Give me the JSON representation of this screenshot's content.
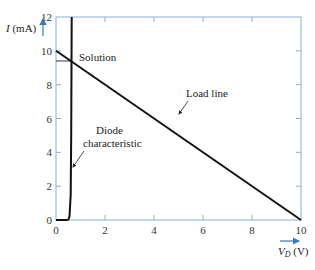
{
  "chart_data": {
    "type": "line",
    "title": "",
    "xlabel": "V_D (V)",
    "xlabel_main": "V",
    "xlabel_sub": "D",
    "xlabel_unit": " (V)",
    "ylabel": "I (mA)",
    "ylabel_main": "I",
    "ylabel_unit": " (mA)",
    "xlim": [
      0,
      10
    ],
    "ylim": [
      0,
      12
    ],
    "xticks": [
      0,
      2,
      4,
      6,
      8,
      10
    ],
    "yticks": [
      0,
      2,
      4,
      6,
      8,
      10,
      12
    ],
    "grid": false,
    "series": [
      {
        "name": "Load line",
        "x": [
          0,
          10
        ],
        "y": [
          10,
          0
        ]
      },
      {
        "name": "Diode characteristic",
        "x": [
          0,
          0.4,
          0.5,
          0.55,
          0.6,
          0.62,
          0.64
        ],
        "y": [
          0,
          0,
          0.02,
          0.2,
          1.5,
          5,
          12
        ]
      }
    ],
    "annotations": [
      {
        "text": "Solution",
        "x": 0.62,
        "y": 9.4
      },
      {
        "text": "Load line",
        "x": 4.8,
        "y": 5.3
      },
      {
        "text": "Diode",
        "x": 0.64,
        "y": 3.2
      },
      {
        "text": "characteristic",
        "x": 0.64,
        "y": 3.2
      }
    ],
    "solution_point": {
      "x": 0.62,
      "y": 9.4
    }
  }
}
